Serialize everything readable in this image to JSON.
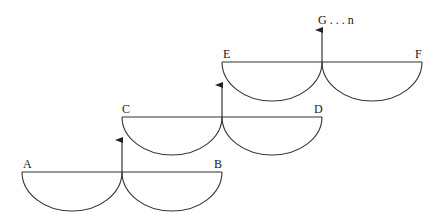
{
  "diagram": {
    "stroke_color": "#333333",
    "background": "#ffffff",
    "stages": [
      {
        "left_label": "A",
        "right_label": "B"
      },
      {
        "left_label": "C",
        "right_label": "D"
      },
      {
        "left_label": "E",
        "right_label": "F"
      }
    ],
    "top_label": "G . . . n"
  }
}
